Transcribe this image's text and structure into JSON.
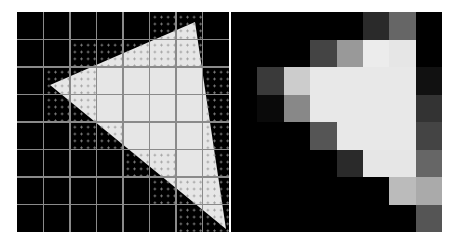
{
  "figure": {
    "grid": {
      "rows": 8,
      "cols": 8
    },
    "colors": {
      "background": "#000000",
      "triangle_fill": "#e6e6e6",
      "grid_line": "#8a8a8a",
      "sample_dot": "#969696"
    },
    "left_panel": {
      "label": "triangle-with-samples",
      "triangle_vertices_px": [
        [
          178,
          10
        ],
        [
          33,
          73
        ],
        [
          209,
          217
        ]
      ],
      "sampled_edge_cells": [
        [
          0,
          5
        ],
        [
          0,
          6
        ],
        [
          1,
          2
        ],
        [
          1,
          3
        ],
        [
          1,
          4
        ],
        [
          1,
          5
        ],
        [
          1,
          6
        ],
        [
          2,
          1
        ],
        [
          2,
          2
        ],
        [
          2,
          7
        ],
        [
          3,
          1
        ],
        [
          3,
          2
        ],
        [
          3,
          7
        ],
        [
          4,
          2
        ],
        [
          4,
          3
        ],
        [
          4,
          7
        ],
        [
          5,
          4
        ],
        [
          5,
          5
        ],
        [
          5,
          7
        ],
        [
          6,
          5
        ],
        [
          6,
          6
        ],
        [
          6,
          7
        ],
        [
          7,
          6
        ],
        [
          7,
          7
        ]
      ]
    },
    "right_panel": {
      "label": "antialiased-pixel-coverage",
      "pixel_shades": [
        [
          "#000000",
          "#000000",
          "#000000",
          "#000000",
          "#000000",
          "#2a2a2a",
          "#666666",
          "#000000"
        ],
        [
          "#000000",
          "#000000",
          "#000000",
          "#444444",
          "#999999",
          "#ececec",
          "#e6e6e6",
          "#000000"
        ],
        [
          "#000000",
          "#3a3a3a",
          "#cccccc",
          "#e8e8e8",
          "#e8e8e8",
          "#e8e8e8",
          "#e8e8e8",
          "#111111"
        ],
        [
          "#000000",
          "#0a0a0a",
          "#888888",
          "#e8e8e8",
          "#e8e8e8",
          "#e8e8e8",
          "#e8e8e8",
          "#333333"
        ],
        [
          "#000000",
          "#000000",
          "#000000",
          "#555555",
          "#e8e8e8",
          "#e8e8e8",
          "#e8e8e8",
          "#444444"
        ],
        [
          "#000000",
          "#000000",
          "#000000",
          "#000000",
          "#2a2a2a",
          "#e6e6e6",
          "#e6e6e6",
          "#666666"
        ],
        [
          "#000000",
          "#000000",
          "#000000",
          "#000000",
          "#000000",
          "#000000",
          "#bbbbbb",
          "#aaaaaa"
        ],
        [
          "#000000",
          "#000000",
          "#000000",
          "#000000",
          "#000000",
          "#000000",
          "#000000",
          "#555555"
        ]
      ]
    }
  }
}
